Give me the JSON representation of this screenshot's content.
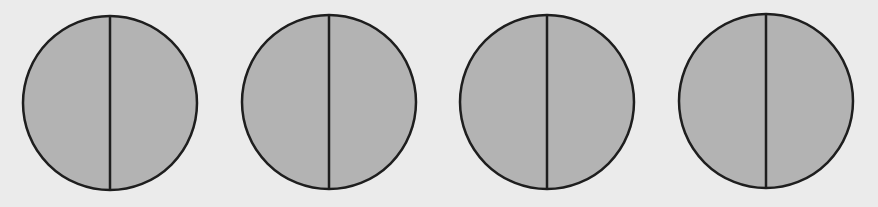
{
  "figure": {
    "background_color": "#ebebeb",
    "fill_color": "#b3b3b3",
    "stroke_color": "#1e1e1e",
    "stroke_width": 2.5,
    "circles": [
      {
        "id": "circle-1",
        "cx": 110,
        "cy": 103,
        "r": 87,
        "parts": 2,
        "shaded_parts": 2
      },
      {
        "id": "circle-2",
        "cx": 329,
        "cy": 102,
        "r": 87,
        "parts": 2,
        "shaded_parts": 2
      },
      {
        "id": "circle-3",
        "cx": 547,
        "cy": 102,
        "r": 87,
        "parts": 2,
        "shaded_parts": 2
      },
      {
        "id": "circle-4",
        "cx": 766,
        "cy": 101,
        "r": 87,
        "parts": 2,
        "shaded_parts": 2
      }
    ]
  }
}
